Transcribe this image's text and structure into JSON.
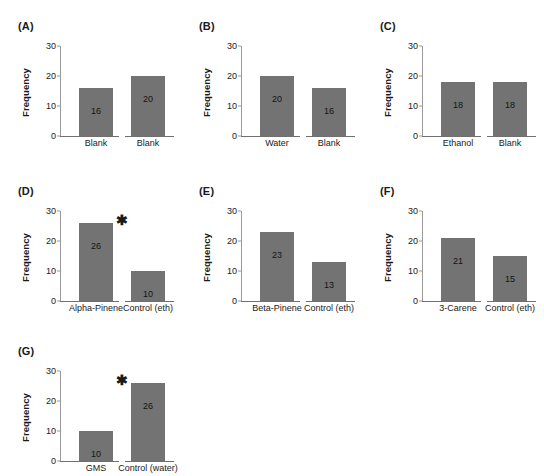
{
  "figure": {
    "axis": {
      "ylabel": "Frequency",
      "yticks": [
        0,
        10,
        20,
        30
      ],
      "ymin": 0,
      "ymax": 30,
      "grid": false
    },
    "style": {
      "bar_color": "#737373",
      "axis_color": "#9a9a9a",
      "text_color": "#1a1a1a",
      "background": "#ffffff"
    },
    "significance_marker": "✱"
  },
  "chart_data": [
    {
      "type": "bar",
      "panel": "(A)",
      "title": "",
      "xlabel": "",
      "ylabel": "Frequency",
      "ylim": [
        0,
        30
      ],
      "yticks": [
        0,
        10,
        20,
        30
      ],
      "grid": false,
      "categories": [
        "Blank",
        "Blank"
      ],
      "values": [
        16,
        20
      ],
      "significant": false,
      "significance_label": ""
    },
    {
      "type": "bar",
      "panel": "(B)",
      "title": "",
      "xlabel": "",
      "ylabel": "Frequency",
      "ylim": [
        0,
        30
      ],
      "yticks": [
        0,
        10,
        20,
        30
      ],
      "grid": false,
      "categories": [
        "Water",
        "Blank"
      ],
      "values": [
        20,
        16
      ],
      "significant": false,
      "significance_label": ""
    },
    {
      "type": "bar",
      "panel": "(C)",
      "title": "",
      "xlabel": "",
      "ylabel": "Frequency",
      "ylim": [
        0,
        30
      ],
      "yticks": [
        0,
        10,
        20,
        30
      ],
      "grid": false,
      "categories": [
        "Ethanol",
        "Blank"
      ],
      "values": [
        18,
        18
      ],
      "significant": false,
      "significance_label": ""
    },
    {
      "type": "bar",
      "panel": "(D)",
      "title": "",
      "xlabel": "",
      "ylabel": "Frequency",
      "ylim": [
        0,
        30
      ],
      "yticks": [
        0,
        10,
        20,
        30
      ],
      "grid": false,
      "categories": [
        "Alpha-Pinene",
        "Control (eth)"
      ],
      "values": [
        26,
        10
      ],
      "significant": true,
      "significance_label": "✱"
    },
    {
      "type": "bar",
      "panel": "(E)",
      "title": "",
      "xlabel": "",
      "ylabel": "Frequency",
      "ylim": [
        0,
        30
      ],
      "yticks": [
        0,
        10,
        20,
        30
      ],
      "grid": false,
      "categories": [
        "Beta-Pinene",
        "Control (eth)"
      ],
      "values": [
        23,
        13
      ],
      "significant": false,
      "significance_label": ""
    },
    {
      "type": "bar",
      "panel": "(F)",
      "title": "",
      "xlabel": "",
      "ylabel": "Frequency",
      "ylim": [
        0,
        30
      ],
      "yticks": [
        0,
        10,
        20,
        30
      ],
      "grid": false,
      "categories": [
        "3-Carene",
        "Control (eth)"
      ],
      "values": [
        21,
        15
      ],
      "significant": false,
      "significance_label": ""
    },
    {
      "type": "bar",
      "panel": "(G)",
      "title": "",
      "xlabel": "",
      "ylabel": "Frequency",
      "ylim": [
        0,
        30
      ],
      "yticks": [
        0,
        10,
        20,
        30
      ],
      "grid": false,
      "categories": [
        "GMS",
        "Control (water)"
      ],
      "values": [
        10,
        26
      ],
      "significant": true,
      "significance_label": "✱"
    }
  ]
}
